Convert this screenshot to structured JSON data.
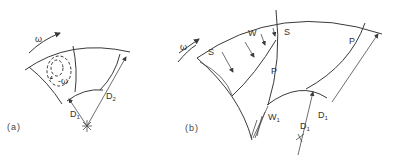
{
  "figure_a": {
    "caption": "(a)",
    "labels": {
      "omega": "ω",
      "relative_eddy": "-ω",
      "d1": "D",
      "d1_sub": "1",
      "d2": "D",
      "d2_sub": "2"
    }
  },
  "figure_b": {
    "caption": "(b)",
    "labels": {
      "omega": "ω",
      "suction_left": "S",
      "wake": "W",
      "suction_right": "S",
      "pressure_mid": "P",
      "pressure_right": "P",
      "inlet_velocity": "W",
      "inlet_velocity_sub": "1",
      "d1": "D",
      "d1_sub": "1",
      "d1_outer": "D",
      "d1_outer_sub": "1"
    }
  },
  "colors": {
    "line": "#3a3a3a",
    "text": "#333333",
    "background": "#ffffff"
  }
}
